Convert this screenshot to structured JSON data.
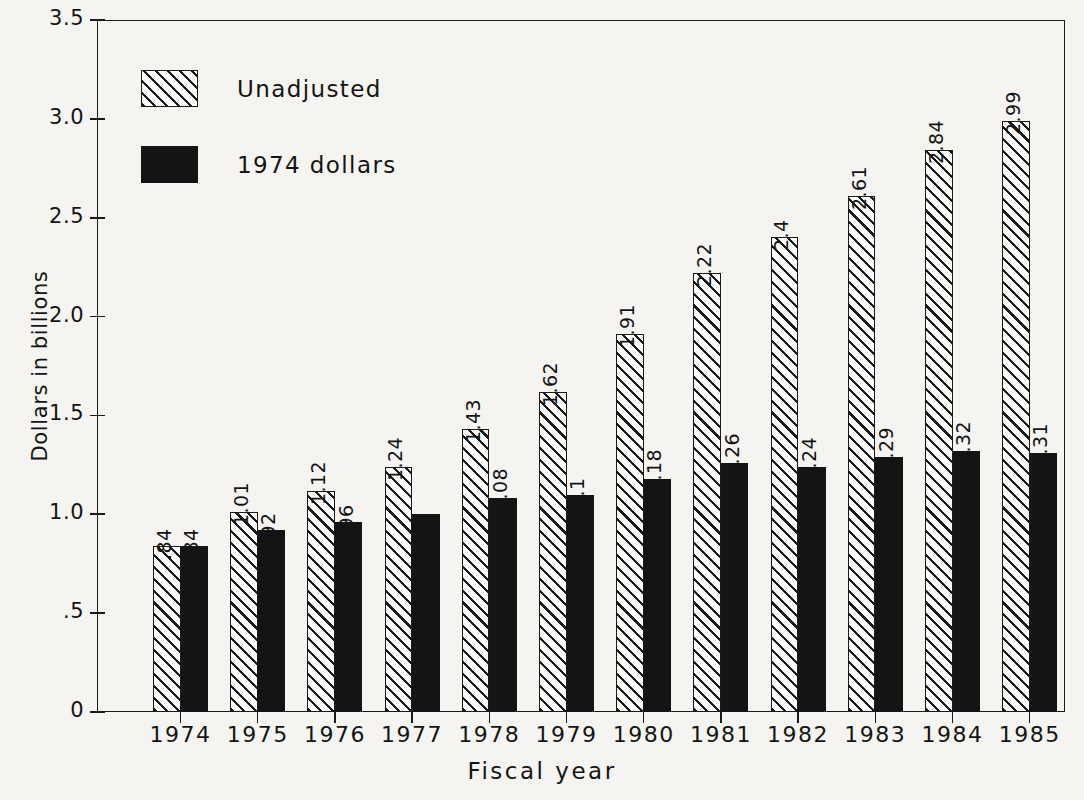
{
  "chart_data": {
    "type": "bar",
    "title": "",
    "xlabel": "Fiscal year",
    "ylabel": "Dollars in billions",
    "categories": [
      "1974",
      "1975",
      "1976",
      "1977",
      "1978",
      "1979",
      "1980",
      "1981",
      "1982",
      "1983",
      "1984",
      "1985"
    ],
    "series": [
      {
        "name": "Unadjusted",
        "values": [
          0.84,
          1.01,
          1.12,
          1.24,
          1.43,
          1.62,
          1.91,
          2.22,
          2.4,
          2.61,
          2.84,
          2.99
        ],
        "labels": [
          ".84",
          "1.01",
          "1.12",
          "1.24",
          "1.43",
          "1.62",
          "1.91",
          "2.22",
          "2.4",
          "2.61",
          "2.84",
          "2.99"
        ],
        "style": "hatched"
      },
      {
        "name": "1974 dollars",
        "values": [
          0.84,
          0.92,
          0.96,
          1.0,
          1.08,
          1.1,
          1.18,
          1.26,
          1.24,
          1.29,
          1.32,
          1.31
        ],
        "labels": [
          ".84",
          ".92",
          ".96",
          "1",
          "1.08",
          "1.1",
          "1.18",
          "1.26",
          "1.24",
          "1.29",
          "1.32",
          "1.31"
        ],
        "style": "solid"
      }
    ],
    "ylim": [
      0,
      3.5
    ],
    "yticks": [
      0,
      0.5,
      1.0,
      1.5,
      2.0,
      2.5,
      3.0,
      3.5
    ],
    "ytick_labels": [
      "0",
      ".5",
      "1.0",
      "1.5",
      "2.0",
      "2.5",
      "3.0",
      "3.5"
    ],
    "grid": false,
    "legend_position": "upper-left",
    "colors": {
      "ink": "#141414",
      "background": "#f5f4f1",
      "solid_fill": "#141414",
      "hatched_fill": "#fbfbf9"
    }
  },
  "legend": {
    "items": [
      {
        "label": "Unadjusted",
        "style": "hatched"
      },
      {
        "label": "1974 dollars",
        "style": "solid"
      }
    ]
  },
  "axes": {
    "y_title": "Dollars in billions",
    "x_title": "Fiscal year"
  }
}
